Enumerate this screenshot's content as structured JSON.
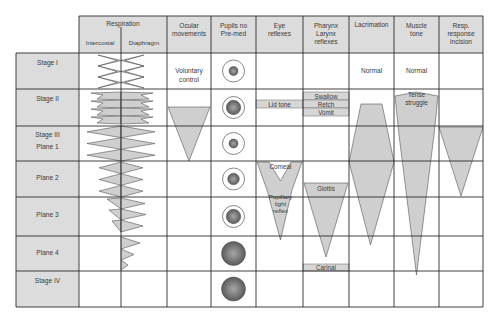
{
  "diagram": {
    "colors": {
      "header_fill": "#dcdcdc",
      "stage_fill": "#dcdcdc",
      "shape_fill": "#cfcfcf",
      "band_fill": "#d6d6d6",
      "grid_line": "#2b2b2b",
      "pupil_outer": "#6e6e6e",
      "pupil_inner": "#a8a8a8"
    },
    "headers": {
      "respiration": "Respiration",
      "intercostal": "Intercostal",
      "diaphragm": "Diaphragm",
      "ocular": [
        "Ocular",
        "movements"
      ],
      "pupils": [
        "Pupils no",
        "Pre-med"
      ],
      "eye": [
        "Eye",
        "reflexes"
      ],
      "pharynx": [
        "Pharynx",
        "Larynx",
        "reflexes"
      ],
      "lacrimation": [
        "Lacrimation"
      ],
      "muscle": [
        "Muscle",
        "tone"
      ],
      "resp_response": [
        "Resp.",
        "response",
        "incision"
      ]
    },
    "stages": [
      {
        "label": [
          "Stage I"
        ]
      },
      {
        "label": [
          "Stage II"
        ]
      },
      {
        "label": [
          "Stage III",
          "Plane 1"
        ]
      },
      {
        "label": [
          "Plane 2"
        ]
      },
      {
        "label": [
          "Plane 3"
        ]
      },
      {
        "label": [
          "Plane 4"
        ]
      },
      {
        "label": [
          "Stage IV"
        ]
      }
    ],
    "cells": {
      "ocular_stage1": [
        "Voluntary",
        "control"
      ],
      "lacrimation_stage1": "Normal",
      "muscle_stage1": "Normal",
      "muscle_stage2": [
        "Tense",
        "struggle"
      ],
      "lid_tone": "Lid tone",
      "swallow": "Swallow",
      "retch": "Retch",
      "vomit": "Vomit",
      "corneal": "Corneal",
      "pupillary": [
        "Pupillary",
        "light",
        "reflex"
      ],
      "glottis": "Glottis",
      "carinal": "Carinal"
    },
    "pupils": [
      {
        "stage": "Stage I",
        "ring": true,
        "size": "small"
      },
      {
        "stage": "Stage II",
        "ring": true,
        "size": "large"
      },
      {
        "stage": "Stage III Plane 1",
        "ring": true,
        "size": "small"
      },
      {
        "stage": "Plane 2",
        "ring": true,
        "size": "medium"
      },
      {
        "stage": "Plane 3",
        "ring": true,
        "size": "large"
      },
      {
        "stage": "Plane 4",
        "ring": false,
        "size": "dilated"
      },
      {
        "stage": "Stage IV",
        "ring": false,
        "size": "dilated"
      }
    ]
  }
}
